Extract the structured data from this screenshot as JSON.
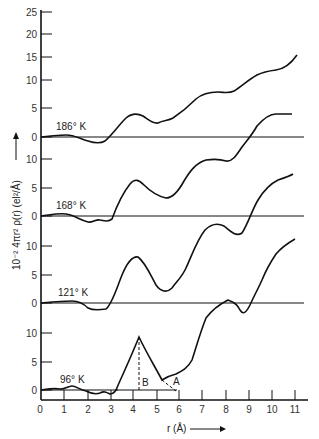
{
  "chart_data": {
    "type": "line",
    "title": "",
    "xlabel": "r (Å)",
    "ylabel": "10⁻² 4πr² ρ(r) (el²/Å)",
    "xlim": [
      0,
      11.5
    ],
    "x_ticks": [
      "0",
      "1",
      "2",
      "3",
      "4",
      "5",
      "6",
      "7",
      "8",
      "9",
      "10",
      "11"
    ],
    "y_ticks_top": [
      "25",
      "20",
      "15",
      "10",
      "5",
      "0"
    ],
    "layout": "stacked offset curves sharing x-axis; each with own zero baseline",
    "grid": false,
    "series": [
      {
        "name": "186° K",
        "label": "186° K",
        "r": [
          0,
          0.5,
          1.0,
          1.5,
          2.0,
          2.3,
          2.6,
          3.0,
          3.5,
          4.0,
          4.4,
          4.8,
          5.2,
          5.6,
          6.0,
          6.5,
          7.0,
          7.5,
          8.0,
          8.5,
          9.0,
          9.5,
          10.0,
          10.5,
          10.8,
          11.2
        ],
        "values": [
          0,
          0.2,
          0.4,
          0.2,
          -0.4,
          -1.0,
          -1.2,
          -0.5,
          1.5,
          3.5,
          4.2,
          3.5,
          2.2,
          1.6,
          2.5,
          3.5,
          4.5,
          6.3,
          7.5,
          7.7,
          7.2,
          8.3,
          10.0,
          11.5,
          12.0,
          12.5,
          15.0
        ]
      },
      {
        "name": "168° K",
        "label": "168° K",
        "r": [
          0,
          0.5,
          1.0,
          1.5,
          2.0,
          2.3,
          2.6,
          3.0,
          3.2,
          3.5,
          4.0,
          4.4,
          4.8,
          5.2,
          5.7,
          6.0,
          6.5,
          7.0,
          7.5,
          8.0,
          8.5,
          9.0,
          9.5,
          10.0,
          10.5,
          11.0,
          11.3
        ],
        "values": [
          0,
          0.2,
          0.5,
          0.3,
          -0.8,
          -1.5,
          -1.0,
          -1.5,
          0.0,
          3.0,
          5.5,
          6.5,
          5.2,
          3.2,
          1.8,
          2.2,
          4.5,
          7.5,
          9.5,
          10.2,
          10.2,
          10.0,
          11.2,
          12.8,
          14.0,
          14.5,
          14.6
        ]
      },
      {
        "name": "121° K",
        "label": "121° K",
        "r": [
          0,
          0.5,
          1.0,
          1.5,
          2.0,
          2.3,
          2.6,
          3.0,
          3.3,
          3.6,
          4.0,
          4.4,
          4.8,
          5.2,
          5.6,
          6.0,
          6.5,
          7.0,
          7.5,
          8.0,
          8.5,
          9.0,
          9.5,
          10.0,
          10.5,
          11.0,
          11.3
        ],
        "values": [
          0,
          0.2,
          0.4,
          0.5,
          0.3,
          -0.8,
          -1.0,
          -1.2,
          0.0,
          4.0,
          8.0,
          9.0,
          6.5,
          4.0,
          2.5,
          3.5,
          5.5,
          10.0,
          12.5,
          12.8,
          10.0,
          8.0,
          9.5,
          13.0,
          14.5,
          16.0,
          17.0
        ]
      },
      {
        "name": "96° K",
        "label": "96° K",
        "r": [
          0,
          0.5,
          1.0,
          1.3,
          1.7,
          2.0,
          2.4,
          2.8,
          3.0,
          3.2,
          3.3,
          3.8,
          4.3,
          4.8,
          5.3,
          5.6,
          5.9,
          6.3,
          6.6,
          7.0,
          7.5,
          8.0,
          8.2,
          8.5,
          8.9,
          9.2,
          9.5,
          10.0
        ],
        "values": [
          0,
          0.3,
          0.3,
          1.0,
          0.3,
          -0.5,
          -1.2,
          -0.5,
          -1.0,
          -0.5,
          0.5,
          5.0,
          9.5,
          7.0,
          4.0,
          4.5,
          5.0,
          6.0,
          6.5,
          9.0,
          14.0,
          17.0,
          17.5,
          16.5,
          12.0,
          8.0,
          5.0,
          3.0
        ]
      }
    ],
    "annotations": [
      {
        "text": "B",
        "desc": "dashed vertical line from peak at r≈4.3 down to baseline of 96° K curve"
      },
      {
        "text": "A",
        "desc": "dashed extension of descending peak slope to baseline at r≈5.9"
      }
    ]
  },
  "axes": {
    "x_title": "r (Å)",
    "y_title": "10⁻² 4πr² ρ(r) (el²/Å)",
    "y_ticks": [
      {
        "label": "25",
        "y": 12
      },
      {
        "label": "20",
        "y": 34
      },
      {
        "label": "15",
        "y": 57
      },
      {
        "label": "10",
        "y": 80
      },
      {
        "label": "5",
        "y": 108
      },
      {
        "label": "0",
        "y": 137
      },
      {
        "label": "10",
        "y": 159
      },
      {
        "label": "5",
        "y": 188
      },
      {
        "label": "0",
        "y": 216
      },
      {
        "label": "10",
        "y": 246
      },
      {
        "label": "5",
        "y": 275
      },
      {
        "label": "0",
        "y": 303
      },
      {
        "label": "10",
        "y": 333
      },
      {
        "label": "5",
        "y": 362
      },
      {
        "label": "0",
        "y": 390
      }
    ]
  },
  "labels": {
    "t186": "186° K",
    "t168": "168° K",
    "t121": "121° K",
    "t96": "96° K",
    "peak_b": "B",
    "peak_a": "A"
  }
}
